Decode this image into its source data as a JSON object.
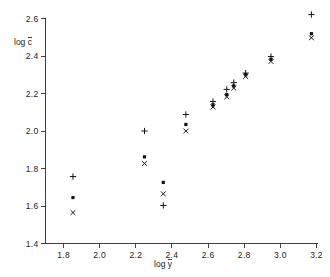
{
  "chart_data": {
    "type": "scatter",
    "title": "",
    "xlabel": "log ȳ",
    "ylabel": "log c̄",
    "xlim": [
      1.7,
      3.2
    ],
    "ylim": [
      1.4,
      2.6
    ],
    "grid": false,
    "legend": "none",
    "xticks": [
      1.8,
      2.0,
      2.2,
      2.4,
      2.6,
      2.8,
      3.0,
      3.2
    ],
    "xtick_labels": [
      "1.8",
      "2.0",
      "2.2",
      "2.4",
      "2.6",
      "2.8",
      "3.0",
      "3.2"
    ],
    "yticks": [
      1.4,
      1.6,
      1.8,
      2.0,
      2.2,
      2.4,
      2.6
    ],
    "ytick_labels": [
      "1.4",
      "1.6",
      "1.8",
      "2.0",
      "2.2",
      "2.4",
      "2.6"
    ],
    "series": [
      {
        "name": "plus",
        "marker": "plus",
        "color": "#141414",
        "points": [
          {
            "x": 1.852,
            "y": 1.757
          },
          {
            "x": 2.248,
            "y": 2.0
          },
          {
            "x": 2.352,
            "y": 1.603
          },
          {
            "x": 2.477,
            "y": 2.088
          },
          {
            "x": 2.627,
            "y": 2.157
          },
          {
            "x": 2.703,
            "y": 2.222
          },
          {
            "x": 2.742,
            "y": 2.258
          },
          {
            "x": 2.808,
            "y": 2.309
          },
          {
            "x": 2.948,
            "y": 2.397
          },
          {
            "x": 3.172,
            "y": 2.621
          }
        ]
      },
      {
        "name": "dot",
        "marker": "dot",
        "color": "#141414",
        "points": [
          {
            "x": 1.852,
            "y": 1.645
          },
          {
            "x": 2.248,
            "y": 1.862
          },
          {
            "x": 2.352,
            "y": 1.726
          },
          {
            "x": 2.477,
            "y": 2.035
          },
          {
            "x": 2.627,
            "y": 2.14
          },
          {
            "x": 2.703,
            "y": 2.194
          },
          {
            "x": 2.742,
            "y": 2.241
          },
          {
            "x": 2.808,
            "y": 2.3
          },
          {
            "x": 2.948,
            "y": 2.382
          },
          {
            "x": 3.172,
            "y": 2.519
          }
        ]
      },
      {
        "name": "cross",
        "marker": "cross",
        "color": "#141414",
        "points": [
          {
            "x": 1.852,
            "y": 1.565
          },
          {
            "x": 2.248,
            "y": 1.827
          },
          {
            "x": 2.352,
            "y": 1.665
          },
          {
            "x": 2.477,
            "y": 2.0
          },
          {
            "x": 2.627,
            "y": 2.128
          },
          {
            "x": 2.703,
            "y": 2.182
          },
          {
            "x": 2.742,
            "y": 2.229
          },
          {
            "x": 2.808,
            "y": 2.291
          },
          {
            "x": 2.948,
            "y": 2.371
          },
          {
            "x": 3.172,
            "y": 2.497
          }
        ]
      }
    ]
  }
}
